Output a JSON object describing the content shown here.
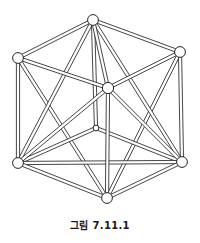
{
  "figure": {
    "caption": "그림 7.11.1",
    "colors": {
      "background": "#ffffff",
      "stroke": "#262626",
      "rod_fill": "#ffffff",
      "vertex_fill": "#ffffff",
      "caption_text": "#1a1a1a"
    },
    "style": {
      "rod_width": 3.2,
      "stroke_width": 0.85,
      "vertex_radius": 5.2,
      "hidden_vertex_radius": 2.8
    },
    "vertices": [
      {
        "id": "top",
        "label": "v1",
        "x": 93,
        "y": 20,
        "r": 5.4,
        "hidden": false
      },
      {
        "id": "top-left",
        "label": "v2",
        "x": 18,
        "y": 58,
        "r": 5.4,
        "hidden": false
      },
      {
        "id": "top-right",
        "label": "v3",
        "x": 180,
        "y": 52,
        "r": 5.4,
        "hidden": false
      },
      {
        "id": "center",
        "label": "v4",
        "x": 108,
        "y": 88,
        "r": 5.6,
        "hidden": false
      },
      {
        "id": "back-center",
        "label": "v5",
        "x": 96,
        "y": 128,
        "r": 2.9,
        "hidden": true
      },
      {
        "id": "bottom-left",
        "label": "v6",
        "x": 18,
        "y": 163,
        "r": 5.4,
        "hidden": false
      },
      {
        "id": "bottom-right",
        "label": "v7",
        "x": 182,
        "y": 162,
        "r": 5.4,
        "hidden": false
      },
      {
        "id": "bottom",
        "label": "v8",
        "x": 107,
        "y": 198,
        "r": 5.4,
        "hidden": false
      }
    ],
    "edges": [
      {
        "from": "top",
        "to": "top-left"
      },
      {
        "from": "top",
        "to": "top-right"
      },
      {
        "from": "top",
        "to": "center"
      },
      {
        "from": "top",
        "to": "bottom-left"
      },
      {
        "from": "top",
        "to": "bottom-right"
      },
      {
        "from": "top",
        "to": "back-center"
      },
      {
        "from": "top-left",
        "to": "center"
      },
      {
        "from": "top-left",
        "to": "bottom-left"
      },
      {
        "from": "top-left",
        "to": "bottom"
      },
      {
        "from": "top-right",
        "to": "center"
      },
      {
        "from": "top-right",
        "to": "bottom-right"
      },
      {
        "from": "top-right",
        "to": "bottom"
      },
      {
        "from": "center",
        "to": "bottom-left"
      },
      {
        "from": "center",
        "to": "bottom-right"
      },
      {
        "from": "center",
        "to": "bottom"
      },
      {
        "from": "back-center",
        "to": "bottom-left"
      },
      {
        "from": "back-center",
        "to": "bottom-right"
      },
      {
        "from": "bottom-left",
        "to": "bottom-right"
      },
      {
        "from": "bottom-left",
        "to": "bottom"
      },
      {
        "from": "bottom-right",
        "to": "bottom"
      }
    ],
    "draw_order": [
      "top-left:bottom",
      "top-right:bottom",
      "top:bottom-left",
      "top:bottom-right",
      "top:back-center",
      "back-center:bottom-left",
      "back-center:bottom-right",
      "bottom-left:bottom-right",
      "top:top-left",
      "top:top-right",
      "top-left:center",
      "top-right:center",
      "top-left:bottom-left",
      "top-right:bottom-right",
      "top:center",
      "center:bottom-left",
      "center:bottom-right",
      "center:bottom",
      "bottom-left:bottom",
      "bottom-right:bottom"
    ]
  }
}
